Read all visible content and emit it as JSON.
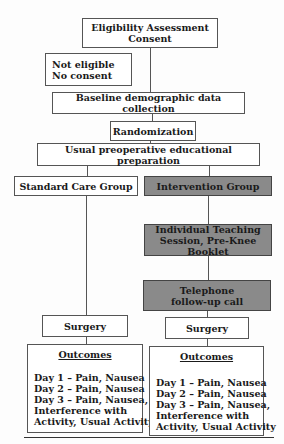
{
  "diagram": {
    "eligibility": {
      "line1": "Eligibility Assessment",
      "line2": "Consent"
    },
    "not_eligible": {
      "line1": "Not eligible",
      "line2": "No consent"
    },
    "baseline": "Baseline demographic data collection",
    "randomization": "Randomization",
    "usual_prep": "Usual preoperative educational preparation",
    "standard_group": "Standard Care Group",
    "intervention_group": "Intervention Group",
    "teaching": {
      "line1": "Individual Teaching",
      "line2": "Session, Pre-Knee Booklet"
    },
    "telephone": {
      "line1": "Telephone",
      "line2": "follow-up call"
    },
    "surgery_left": "Surgery",
    "surgery_right": "Surgery",
    "outcomes_left": {
      "title": "Outcomes",
      "items": [
        "Day 1 – Pain, Nausea",
        "Day 2 – Pain, Nausea",
        "Day 3 – Pain, Nausea,",
        "Interference with",
        "Activity, Usual Activity"
      ]
    },
    "outcomes_right": {
      "title": "Outcomes",
      "items": [
        "Day 1 – Pain, Nausea",
        "Day 2 – Pain, Nausea",
        "Day 3 – Pain, Nausea,",
        "Interference with",
        "Activity, Usual Activity"
      ]
    },
    "colors": {
      "intervention_fill": "#8a8a8a",
      "standard_fill": "#ffffff",
      "border": "#555555"
    }
  }
}
